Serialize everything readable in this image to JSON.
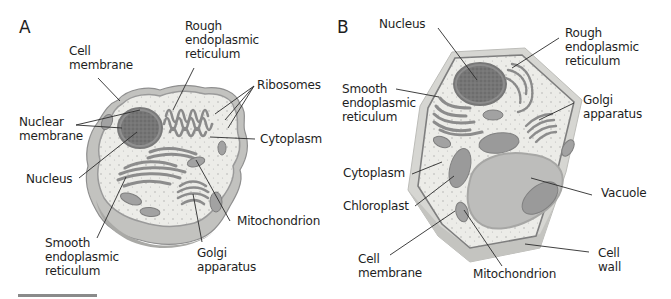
{
  "figure": {
    "panels": [
      {
        "letter": "A",
        "subject": "animal-cell",
        "labels": {
          "rough_er": "Rough\nendoplasmic\nreticulum",
          "cell_membrane": "Cell\nmembrane",
          "ribosomes": "Ribosomes",
          "nuclear_membrane": "Nuclear\nmembrane",
          "cytoplasm": "Cytoplasm",
          "nucleus": "Nucleus",
          "mitochondrion": "Mitochondrion",
          "smooth_er": "Smooth\nendoplasmic\nreticulum",
          "golgi": "Golgi\napparatus"
        }
      },
      {
        "letter": "B",
        "subject": "plant-cell",
        "labels": {
          "nucleus": "Nucleus",
          "rough_er": "Rough\nendoplasmic\nreticulum",
          "smooth_er": "Smooth\nendoplasmic\nreticulum",
          "golgi": "Golgi\napparatus",
          "cytoplasm": "Cytoplasm",
          "vacuole": "Vacuole",
          "chloroplast": "Chloroplast",
          "cell_membrane": "Cell\nmembrane",
          "mitochondrion": "Mitochondrion",
          "cell_wall": "Cell\nwall"
        }
      }
    ],
    "scale_bar": true,
    "colors": {
      "cytoplasm": "#ecece8",
      "membrane": "#8d8d8d",
      "nucleus": "#6f6f6f",
      "organelle": "#a6a6a6",
      "cell_wall": "#cfcfcb",
      "vacuole": "#bdbdbb",
      "leader_line": "#2a2a2a"
    }
  }
}
